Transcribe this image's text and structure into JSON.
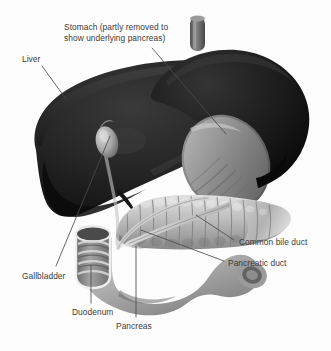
{
  "figure": {
    "background_color": "#fdfdfd",
    "label_text_color": "#3b3b3b",
    "leader_line_color": "#4a4a4a",
    "organ_colors": {
      "liver_dark": "#1d1d1d",
      "liver_mid": "#2e2e2e",
      "stomach_dark": "#141414",
      "stomach_cut_face": "#8f8f8f",
      "stomach_cut_rim": "#6d6d6d",
      "esophagus": "#6f6f6f",
      "pancreas_light": "#c9c9c9",
      "pancreas_mid": "#a6a6a6",
      "pancreas_shadow": "#7e7e7e",
      "duodenum_light": "#c4c4c4",
      "duodenum_mid": "#9d9d9d",
      "duodenum_shadow": "#6f6f6f",
      "gallbladder": "#b9b9b9",
      "duct": "#d5d5d5"
    }
  },
  "labels": [
    {
      "id": "stomach",
      "text": "Stomach (partly removed to\nshow underlying pancreas)",
      "x": 64,
      "y": 22,
      "leader": {
        "x1": 152,
        "y1": 48,
        "x2": 226,
        "y2": 134
      }
    },
    {
      "id": "liver",
      "text": "Liver",
      "x": 22,
      "y": 54,
      "leader": {
        "x1": 42,
        "y1": 66,
        "x2": 66,
        "y2": 99
      }
    },
    {
      "id": "common-bile-duct",
      "text": "Common bile duct",
      "x": 239,
      "y": 237,
      "leader": {
        "x1": 234,
        "y1": 240,
        "x2": 196,
        "y2": 215
      }
    },
    {
      "id": "pancreatic-duct",
      "text": "Pancreatic duct",
      "x": 228,
      "y": 258,
      "leader": {
        "x1": 224,
        "y1": 261,
        "x2": 141,
        "y2": 230
      }
    },
    {
      "id": "gallbladder",
      "text": "Gallbladder",
      "x": 22,
      "y": 271,
      "leader": {
        "x1": 56,
        "y1": 266,
        "x2": 110,
        "y2": 136
      }
    },
    {
      "id": "duodenum",
      "text": "Duodenum",
      "x": 72,
      "y": 307,
      "leader": {
        "x1": 91,
        "y1": 303,
        "x2": 91,
        "y2": 265
      }
    },
    {
      "id": "pancreas",
      "text": "Pancreas",
      "x": 116,
      "y": 321,
      "leader": {
        "x1": 136,
        "y1": 317,
        "x2": 136,
        "y2": 246
      }
    }
  ],
  "organs": [
    {
      "id": "liver",
      "name": "Liver"
    },
    {
      "id": "stomach",
      "name": "Stomach"
    },
    {
      "id": "esophagus",
      "name": "Esophagus"
    },
    {
      "id": "gallbladder",
      "name": "Gallbladder"
    },
    {
      "id": "pancreas",
      "name": "Pancreas"
    },
    {
      "id": "duodenum",
      "name": "Duodenum"
    },
    {
      "id": "common-bile-duct",
      "name": "Common bile duct"
    },
    {
      "id": "pancreatic-duct",
      "name": "Pancreatic duct"
    }
  ]
}
